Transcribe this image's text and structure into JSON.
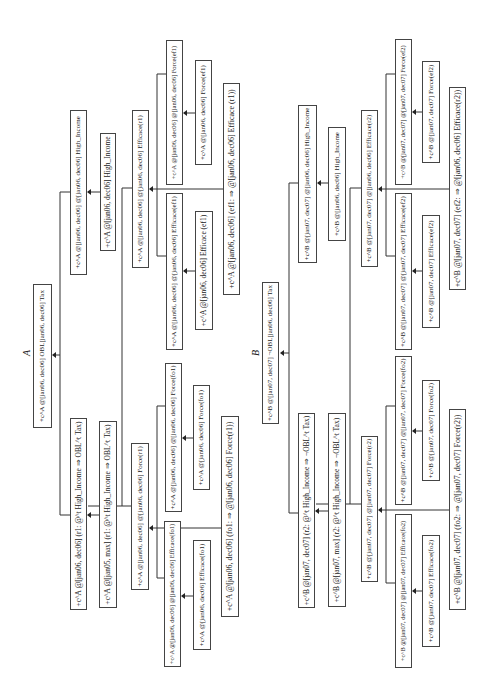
{
  "diagram": {
    "orientation": "rotated -90deg (text reads bottom to top)",
    "panels": [
      {
        "label": "A",
        "root": {
          "text": "+c^A @[jan06, dec06] OBL[jan06, dec06] Tax"
        },
        "nodes": {
          "high_income_1": {
            "text": "+c^A @[jan06, dec06] @[jan06, dec06] High_Income"
          },
          "high_income_2": {
            "text": "+c^A @[jan06, dec06] High_Income"
          },
          "r1_rule": {
            "text": "+c^A @[jan06, dec06] (r1: @^t High_Income ⇒ OBL^t Tax)"
          },
          "r1_rule_mon": {
            "text": "+c^A @[jan05, max] (r1: @^t High_Income ⇒ OBL^t Tax)"
          },
          "efficace_r1": {
            "text": "+c^A @[jan06, dec06] @[jan06, dec06] Efficace(r1)"
          },
          "force_ef1_outer": {
            "text": "+c^A @[jan06, dec06] @[jan06, dec06] Force(ef1)"
          },
          "force_ef1_inner": {
            "text": "+c^A @[jan06, dec06] Force(ef1)"
          },
          "efficace_ef1_outer": {
            "text": "+c^A @[jan06, dec06] @[jan06, dec06] Efficace(ef1)"
          },
          "efficace_ef1_inner": {
            "text": "+c^A @[jan06, dec06] Efficace (ef1)"
          },
          "ef1_rule": {
            "text": "+c^A @[jan06, dec06] (ef1:  ⇒  @[jan06, dec06] Efficace (r1))"
          },
          "force_r1": {
            "text": "+c^A @[jan06, dec06] @[jan06, dec06] Force(r1)"
          },
          "force_fo1_outer": {
            "text": "+c^A @[jan06, dec06] @[jan06, dec06] Force(fo1)"
          },
          "force_fo1_inner": {
            "text": "+c^A @[jan06, dec06] Force(fo1)"
          },
          "efficace_fo1_outer": {
            "text": "+c^A @[jan06, dec06] @[jan06, dec06] Efficace(fo1)"
          },
          "efficace_fo1_inner": {
            "text": "+c^A @[jan06, dec06] Efficace(fo1)"
          },
          "fo1_rule": {
            "text": "+c^A @[jan06, dec06] (fo1:  ⇒  @[jan06, dec06] Force(r1))"
          }
        }
      },
      {
        "label": "B",
        "root": {
          "text": "+c^B @[jan07, dec07] ¬OBL[jan06, dec06] Tax"
        },
        "nodes": {
          "high_income_1": {
            "text": "+c^B @[jan07, dec07] @[jan06, dec06] High_Income"
          },
          "high_income_2": {
            "text": "+c^B @[jan06, dec06] High_Income"
          },
          "r2_rule": {
            "text": "+c^B @[jan07, dec07] (r2: @^t High_Income ⇒ ¬OBL^t Tax)"
          },
          "r2_rule_mon": {
            "text": "+c^B @[jan07, max] (r2: @^t High_Income ⇒ ¬OBL^t Tax)"
          },
          "efficace_r2": {
            "text": "+c^B @[jan07, dec07] @[jan06, dec06] Efficace(r2)"
          },
          "force_ef2_outer": {
            "text": "+c^B @[jan07, dec07] @[jan07, dec07] Force(ef2)"
          },
          "force_ef2_inner": {
            "text": "+c^B @[jan07, dec07] Force(ef2)"
          },
          "efficace_ef2_outer": {
            "text": "+c^B @[jan07, dec07] @[jan07, dec07] Efficace(ef2)"
          },
          "efficace_ef2_inner": {
            "text": "+c^B @[jan07, dec07] Efficace(ef2)"
          },
          "ef2_rule": {
            "text": "+c^B @[jan07, dec07] (ef2:  ⇒  @[jan06, dec06] Efficace(r2))"
          },
          "force_r2": {
            "text": "+c^B @[jan07, dec07] @[jan07, dec07] Force(r2)"
          },
          "force_fo2_outer": {
            "text": "+c^B @[jan07, dec07] @[jan07, dec07] Force(fo2)"
          },
          "force_fo2_inner": {
            "text": "+c^B @[jan07, dec07] Force(fo2)"
          },
          "efficace_fo2_outer": {
            "text": "+c^B @[jan07, dec07] @[jan07, dec07] Efficace(fo2)"
          },
          "efficace_fo2_inner": {
            "text": "+c^B @[jan07, dec07] Efficace(fo2)"
          },
          "fo2_rule": {
            "text": "+c^B @[jan07, dec07] (fo2:  ⇒  @[jan07, dec07] Force(r2))"
          }
        }
      }
    ]
  }
}
